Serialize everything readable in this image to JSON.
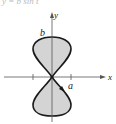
{
  "figure": {
    "equation_partial": "y = b sin t",
    "axis_labels": {
      "x": "x",
      "y": "y"
    },
    "point_labels": {
      "a": "a",
      "b": "b"
    },
    "colors": {
      "curve": "#1a1a1a",
      "fill": "#d4d4d4",
      "axis": "#555555"
    },
    "curve": "figure-eight (lemniscate-like) parametric curve, vertical orientation, crossing at origin",
    "x_ticks": [
      "-a",
      "a"
    ],
    "direction_arrow": "on lower lobe, pointing down-right"
  }
}
